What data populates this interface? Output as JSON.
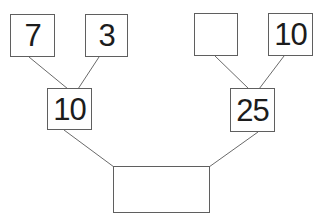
{
  "diagram": {
    "type": "addition-number-tree",
    "colors": {
      "background": "#ffffff",
      "box_border": "#5f5f5f",
      "connector_line": "#6a6a6a",
      "text": "#1c1c1c"
    },
    "nodes": {
      "top_left_addend_1": {
        "value": "7"
      },
      "top_left_addend_2": {
        "value": "3"
      },
      "top_right_addend_1": {
        "value": ""
      },
      "top_right_addend_2": {
        "value": "10"
      },
      "mid_left_sum": {
        "value": "10"
      },
      "mid_right_sum": {
        "value": "25"
      },
      "bottom_total": {
        "value": ""
      }
    }
  }
}
